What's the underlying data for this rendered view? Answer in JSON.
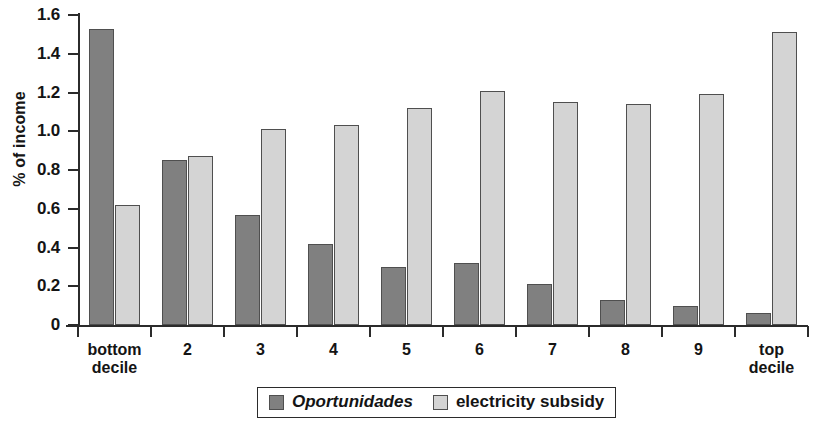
{
  "chart_data": {
    "type": "bar",
    "title": "",
    "xlabel": "",
    "ylabel": "% of income",
    "ylim": [
      0,
      1.6
    ],
    "ytick_labels": [
      "0",
      "0.2",
      "0.4",
      "0.6",
      "0.8",
      "1.0",
      "1.2",
      "1.4",
      "1.6"
    ],
    "ytick_values": [
      0,
      0.2,
      0.4,
      0.6,
      0.8,
      1.0,
      1.2,
      1.4,
      1.6
    ],
    "grid": false,
    "legend_position": "bottom-center",
    "categories": [
      "bottom\ndecile",
      "2",
      "3",
      "4",
      "5",
      "6",
      "7",
      "8",
      "9",
      "top\ndecile"
    ],
    "series": [
      {
        "name": "Oportunidades",
        "italic": true,
        "color": "#808080",
        "values": [
          1.53,
          0.85,
          0.57,
          0.42,
          0.3,
          0.32,
          0.21,
          0.13,
          0.1,
          0.06
        ]
      },
      {
        "name": "electricity subsidy",
        "italic": false,
        "color": "#d4d4d4",
        "values": [
          0.62,
          0.87,
          1.01,
          1.03,
          1.12,
          1.21,
          1.15,
          1.14,
          1.19,
          1.51
        ]
      }
    ]
  }
}
